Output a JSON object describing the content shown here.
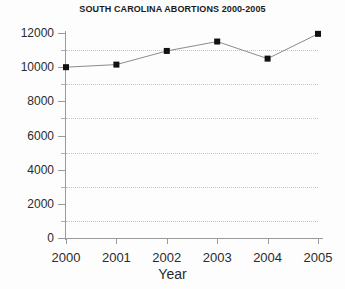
{
  "chart_data": {
    "type": "line",
    "title": "SOUTH CAROLINA ABORTIONS 2000-2005",
    "xlabel": "Year",
    "ylabel": "",
    "categories": [
      "2000",
      "2001",
      "2002",
      "2003",
      "2004",
      "2005"
    ],
    "x": [
      2000,
      2001,
      2002,
      2003,
      2004,
      2005
    ],
    "values": [
      10000,
      10150,
      10950,
      11500,
      10500,
      11950
    ],
    "series": [
      {
        "name": "South Carolina abortions",
        "values": [
          10000,
          10150,
          10950,
          11500,
          10500,
          11950
        ]
      }
    ],
    "ylim": [
      0,
      12000
    ],
    "xlim": [
      2000,
      2005
    ],
    "y_major_ticks": [
      0,
      2000,
      4000,
      6000,
      8000,
      10000,
      12000
    ],
    "y_minor_ticks": [
      1000,
      3000,
      5000,
      7000,
      9000,
      11000
    ],
    "y_tick_labels": [
      "0",
      "2000",
      "4000",
      "6000",
      "8000",
      "10000",
      "12000"
    ],
    "gridlines": {
      "horizontal_at": [
        1000,
        3000,
        5000,
        7000,
        9000,
        11000
      ],
      "vertical": false,
      "style": "dotted"
    },
    "legend": null,
    "marker": "square",
    "colors": {
      "line": "#8c8c8c",
      "marker": "#111111",
      "axis": "#9a9a9a",
      "grid": "#c8c4bc",
      "text": "#2b2b2b",
      "background": "#fdfdfd"
    }
  }
}
